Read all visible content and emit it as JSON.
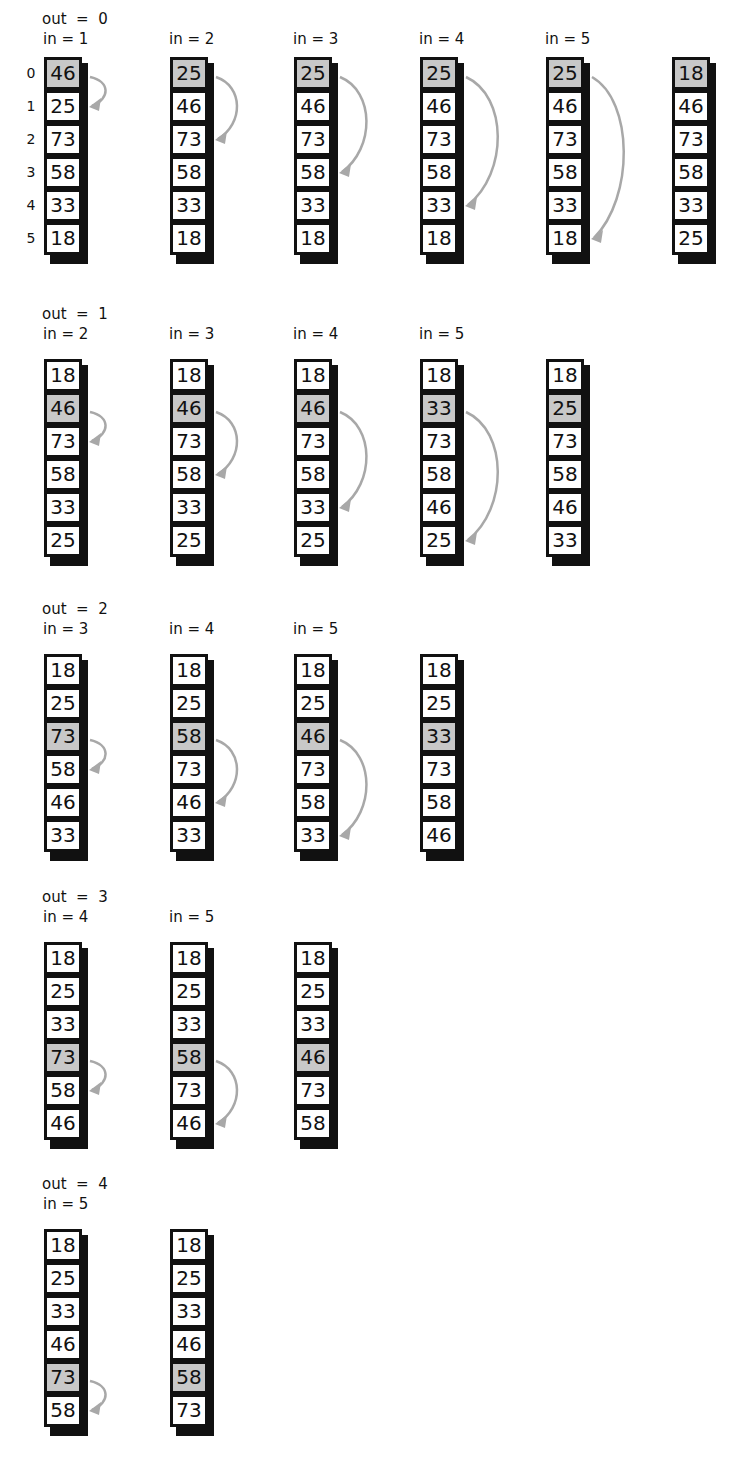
{
  "indices": [
    "0",
    "1",
    "2",
    "3",
    "4",
    "5"
  ],
  "groups": [
    {
      "out_label": "out  =  0",
      "top": 0,
      "steps": [
        {
          "in_label": "in = 1",
          "values": [
            "46",
            "25",
            "73",
            "58",
            "33",
            "18"
          ],
          "highlight": 0,
          "arrow_to": 1
        },
        {
          "in_label": "in = 2",
          "values": [
            "25",
            "46",
            "73",
            "58",
            "33",
            "18"
          ],
          "highlight": 0,
          "arrow_to": 2
        },
        {
          "in_label": "in = 3",
          "values": [
            "25",
            "46",
            "73",
            "58",
            "33",
            "18"
          ],
          "highlight": 0,
          "arrow_to": 3
        },
        {
          "in_label": "in = 4",
          "values": [
            "25",
            "46",
            "73",
            "58",
            "33",
            "18"
          ],
          "highlight": 0,
          "arrow_to": 4
        },
        {
          "in_label": "in = 5",
          "values": [
            "25",
            "46",
            "73",
            "58",
            "33",
            "18"
          ],
          "highlight": 0,
          "arrow_to": 5
        },
        {
          "in_label": "",
          "values": [
            "18",
            "46",
            "73",
            "58",
            "33",
            "25"
          ],
          "highlight": 0,
          "arrow_to": null
        }
      ]
    },
    {
      "out_label": "out  =  1",
      "top": 295,
      "steps": [
        {
          "in_label": "in = 2",
          "values": [
            "18",
            "46",
            "73",
            "58",
            "33",
            "25"
          ],
          "highlight": 1,
          "arrow_to": 2
        },
        {
          "in_label": "in = 3",
          "values": [
            "18",
            "46",
            "73",
            "58",
            "33",
            "25"
          ],
          "highlight": 1,
          "arrow_to": 3
        },
        {
          "in_label": "in = 4",
          "values": [
            "18",
            "46",
            "73",
            "58",
            "33",
            "25"
          ],
          "highlight": 1,
          "arrow_to": 4
        },
        {
          "in_label": "in = 5",
          "values": [
            "18",
            "33",
            "73",
            "58",
            "46",
            "25"
          ],
          "highlight": 1,
          "arrow_to": 5
        },
        {
          "in_label": "",
          "values": [
            "18",
            "25",
            "73",
            "58",
            "46",
            "33"
          ],
          "highlight": 1,
          "arrow_to": null
        }
      ]
    },
    {
      "out_label": "out  =  2",
      "top": 590,
      "steps": [
        {
          "in_label": "in = 3",
          "values": [
            "18",
            "25",
            "73",
            "58",
            "46",
            "33"
          ],
          "highlight": 2,
          "arrow_to": 3
        },
        {
          "in_label": "in = 4",
          "values": [
            "18",
            "25",
            "58",
            "73",
            "46",
            "33"
          ],
          "highlight": 2,
          "arrow_to": 4
        },
        {
          "in_label": "in = 5",
          "values": [
            "18",
            "25",
            "46",
            "73",
            "58",
            "33"
          ],
          "highlight": 2,
          "arrow_to": 5
        },
        {
          "in_label": "",
          "values": [
            "18",
            "25",
            "33",
            "73",
            "58",
            "46"
          ],
          "highlight": 2,
          "arrow_to": null
        }
      ]
    },
    {
      "out_label": "out  =  3",
      "top": 878,
      "steps": [
        {
          "in_label": "in = 4",
          "values": [
            "18",
            "25",
            "33",
            "73",
            "58",
            "46"
          ],
          "highlight": 3,
          "arrow_to": 4
        },
        {
          "in_label": "in = 5",
          "values": [
            "18",
            "25",
            "33",
            "58",
            "73",
            "46"
          ],
          "highlight": 3,
          "arrow_to": 5
        },
        {
          "in_label": "",
          "values": [
            "18",
            "25",
            "33",
            "46",
            "73",
            "58"
          ],
          "highlight": 3,
          "arrow_to": null
        }
      ]
    },
    {
      "out_label": "out  =  4",
      "top": 1165,
      "steps": [
        {
          "in_label": "in = 5",
          "values": [
            "18",
            "25",
            "33",
            "46",
            "73",
            "58"
          ],
          "highlight": 4,
          "arrow_to": 5
        },
        {
          "in_label": "",
          "values": [
            "18",
            "25",
            "33",
            "46",
            "58",
            "73"
          ],
          "highlight": 4,
          "arrow_to": null
        }
      ]
    }
  ],
  "colors": {
    "highlight": "#c8c8c8",
    "arrow": "#a8a8a8",
    "border": "#111111"
  }
}
